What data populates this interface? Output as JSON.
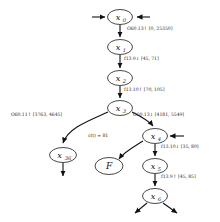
{
  "diagram": {
    "type": "state-transition-graph",
    "nodes": [
      {
        "id": "x0",
        "label": "x",
        "sub": "0",
        "cx": 120,
        "cy": 17,
        "rx": 12.5,
        "ry": 7.5
      },
      {
        "id": "x1",
        "label": "x",
        "sub": "1",
        "cx": 120,
        "cy": 47,
        "rx": 12.5,
        "ry": 7.5
      },
      {
        "id": "x2",
        "label": "x",
        "sub": "2",
        "cx": 120,
        "cy": 78,
        "rx": 12.5,
        "ry": 7.5
      },
      {
        "id": "x3",
        "label": "x",
        "sub": "3",
        "cx": 120,
        "cy": 108,
        "rx": 12.5,
        "ry": 7.5
      },
      {
        "id": "x36",
        "label": "x",
        "sub": "36",
        "cx": 63,
        "cy": 155,
        "rx": 13.5,
        "ry": 7.5
      },
      {
        "id": "F",
        "label": "F",
        "sub": "",
        "cx": 109,
        "cy": 166,
        "rx": 14,
        "ry": 8.5
      },
      {
        "id": "x4",
        "label": "x",
        "sub": "4",
        "cx": 155,
        "cy": 136,
        "rx": 12.5,
        "ry": 7.5
      },
      {
        "id": "x5",
        "label": "x",
        "sub": "5",
        "cx": 155,
        "cy": 166,
        "rx": 12.5,
        "ry": 7.5
      },
      {
        "id": "x6",
        "label": "x",
        "sub": "6",
        "cx": 155,
        "cy": 196,
        "rx": 12.5,
        "ry": 7.5
      }
    ],
    "edges": [
      {
        "id": "e-x0-x1",
        "from": "x0",
        "to": "x1",
        "label": "O60.13↑ [0, 25350]",
        "label_x": 127,
        "label_y": 29
      },
      {
        "id": "e-x1-x2",
        "from": "x1",
        "to": "x2",
        "label": "f13.9↓ [45, 71]",
        "label_x": 124,
        "label_y": 59
      },
      {
        "id": "e-x2-x3",
        "from": "x2",
        "to": "x3",
        "label": "f13.10↑ [70, 105]",
        "label_x": 124,
        "label_y": 90
      },
      {
        "id": "e-x3-x36",
        "from": "x3",
        "to": "x36",
        "label": "O60.11↑ [3763, 4645]",
        "label_x": 12,
        "label_y": 114
      },
      {
        "id": "e-x3-x4",
        "from": "x3",
        "to": "x4",
        "label": "O60.13↓ [4181, 5549]",
        "label_x": 133,
        "label_y": 114
      },
      {
        "id": "e-x4-F",
        "from": "x4",
        "to": "F",
        "label": "c(t) = 81",
        "label_x": 90,
        "label_y": 135
      },
      {
        "id": "e-x4-x5",
        "from": "x4",
        "to": "x5",
        "label": "f13.10↓ [35, 80]",
        "label_x": 161,
        "label_y": 147
      },
      {
        "id": "e-x5-x6",
        "from": "x5",
        "to": "x6",
        "label": "f13.9↑ [45, 85]",
        "label_x": 161,
        "label_y": 177
      }
    ],
    "stubs": [
      {
        "id": "stub-x0-left",
        "name": "incoming-arrow-x0-left"
      },
      {
        "id": "stub-x0-right",
        "name": "incoming-arrow-x0-right"
      },
      {
        "id": "stub-x4-right",
        "name": "incoming-arrow-x4-right"
      },
      {
        "id": "stub-x36-down",
        "name": "outgoing-arrow-x36-down"
      },
      {
        "id": "stub-x6-left",
        "name": "outgoing-arrow-x6-left"
      },
      {
        "id": "stub-x6-right",
        "name": "outgoing-arrow-x6-right"
      }
    ],
    "colors": {
      "stroke": "#111111",
      "node_fill": "#ffffff",
      "label": "#2a2a2a",
      "background": "#ffffff"
    }
  }
}
